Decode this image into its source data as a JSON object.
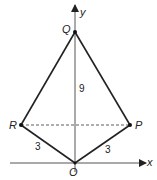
{
  "diagram": {
    "points": {
      "Q": {
        "label": "Q",
        "x": 75,
        "y": 32
      },
      "R": {
        "label": "R",
        "x": 21,
        "y": 125
      },
      "P": {
        "label": "P",
        "x": 130,
        "y": 125
      },
      "O": {
        "label": "O",
        "x": 75,
        "y": 163
      }
    },
    "axes": {
      "x_label": "x",
      "y_label": "y"
    },
    "lengths": {
      "QO": "9",
      "RO": "3",
      "PO": "3"
    },
    "colors": {
      "stroke": "#222222",
      "axis": "#555555",
      "background": "#ffffff"
    }
  }
}
